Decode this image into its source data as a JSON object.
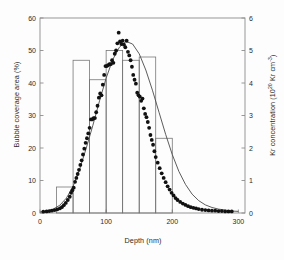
{
  "chart_data": {
    "type": "bar",
    "title": "",
    "xlabel": "Depth (nm)",
    "ylabel": "Bubble coverage area (%)",
    "y2label_parts": {
      "prefix": "Kr concentration (10",
      "exp1": "20",
      "mid": " Kr cm",
      "exp2": "-3",
      "suffix": ")"
    },
    "y2label": "Kr concentration (10^20 Kr cm^-3)",
    "xlim": [
      0,
      310
    ],
    "ylim": [
      0,
      60
    ],
    "y2lim": [
      0,
      6
    ],
    "xticks": [
      0,
      100,
      200,
      300
    ],
    "yticks": [
      0,
      10,
      20,
      30,
      40,
      50,
      60
    ],
    "y2ticks": [
      0,
      1,
      2,
      3,
      4,
      5,
      6
    ],
    "grid": false,
    "legend": false,
    "series": [
      {
        "name": "Bubble coverage area",
        "type": "bar",
        "axis": "left",
        "bin_edges": [
          50,
          75,
          100,
          125,
          150,
          175,
          200
        ],
        "bin_starts": [
          25,
          50,
          75,
          100,
          125,
          150,
          175
        ],
        "values": [
          8,
          47,
          41,
          50,
          47,
          48,
          23
        ]
      },
      {
        "name": "Kr concentration",
        "type": "scatter",
        "axis": "right",
        "x": [
          5,
          10,
          14,
          18,
          22,
          26,
          30,
          33,
          36,
          39,
          42,
          45,
          47,
          49,
          51,
          53,
          55,
          57,
          59,
          61,
          63,
          65,
          67,
          69,
          71,
          73,
          75,
          77,
          79,
          81,
          83,
          85,
          87,
          89,
          91,
          93,
          95,
          97,
          99,
          101,
          103,
          105,
          107,
          109,
          111,
          113,
          115,
          117,
          119,
          121,
          123,
          125,
          127,
          129,
          131,
          133,
          135,
          137,
          139,
          141,
          143,
          145,
          147,
          149,
          151,
          153,
          155,
          157,
          159,
          161,
          163,
          165,
          167,
          169,
          171,
          173,
          175,
          178,
          181,
          184,
          187,
          190,
          193,
          196,
          199,
          202,
          205,
          208,
          212,
          216,
          220,
          224,
          228,
          232,
          236,
          240,
          245,
          250,
          255,
          260,
          265,
          270,
          275,
          280,
          285,
          290
        ],
        "y": [
          0.04,
          0.05,
          0.06,
          0.07,
          0.09,
          0.11,
          0.14,
          0.18,
          0.24,
          0.31,
          0.4,
          0.5,
          0.62,
          0.7,
          0.78,
          0.96,
          1.08,
          1.2,
          1.33,
          1.48,
          1.62,
          1.8,
          1.98,
          2.16,
          2.3,
          2.45,
          2.62,
          2.88,
          2.88,
          2.92,
          2.92,
          3.1,
          3.3,
          3.55,
          3.68,
          3.62,
          3.95,
          4.25,
          4.52,
          4.52,
          4.55,
          4.58,
          4.58,
          4.7,
          4.62,
          4.9,
          5.0,
          5.22,
          5.55,
          5.28,
          5.2,
          5.3,
          5.18,
          5.1,
          5.3,
          4.96,
          4.85,
          4.7,
          4.5,
          4.25,
          4.1,
          3.98,
          3.7,
          3.62,
          3.58,
          3.45,
          3.52,
          3.22,
          3.05,
          2.95,
          2.8,
          2.62,
          2.4,
          2.25,
          2.1,
          1.9,
          1.72,
          1.55,
          1.38,
          1.22,
          1.08,
          0.95,
          0.82,
          0.72,
          0.62,
          0.54,
          0.46,
          0.4,
          0.34,
          0.29,
          0.25,
          0.21,
          0.18,
          0.16,
          0.14,
          0.12,
          0.1,
          0.09,
          0.08,
          0.07,
          0.07,
          0.06,
          0.06,
          0.05,
          0.05,
          0.05
        ]
      },
      {
        "name": "Fitted profile",
        "type": "line",
        "axis": "right",
        "x": [
          0,
          10,
          20,
          30,
          40,
          50,
          60,
          70,
          80,
          90,
          100,
          110,
          120,
          130,
          140,
          150,
          160,
          170,
          180,
          190,
          200,
          210,
          220,
          230,
          240,
          250,
          260,
          270,
          280,
          290,
          300
        ],
        "y": [
          0.03,
          0.06,
          0.12,
          0.24,
          0.46,
          0.82,
          1.35,
          2.0,
          2.7,
          3.45,
          4.15,
          4.72,
          5.1,
          5.28,
          5.2,
          4.9,
          4.4,
          3.78,
          3.1,
          2.42,
          1.8,
          1.28,
          0.88,
          0.58,
          0.38,
          0.25,
          0.17,
          0.12,
          0.09,
          0.06,
          0.05
        ]
      }
    ]
  },
  "axes": {
    "x_tick_labels": [
      "0",
      "100",
      "200",
      "300"
    ],
    "y_tick_labels": [
      "0",
      "10",
      "20",
      "30",
      "40",
      "50",
      "60"
    ],
    "y2_tick_labels": [
      "0",
      "1",
      "2",
      "3",
      "4",
      "5",
      "6"
    ]
  }
}
